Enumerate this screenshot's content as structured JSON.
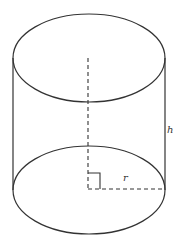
{
  "diagram": {
    "type": "cylinder",
    "labels": {
      "height": "h",
      "radius": "r"
    },
    "colors": {
      "stroke": "#333333",
      "background": "#ffffff"
    },
    "geometry": {
      "top_ellipse": {
        "cx": 89,
        "cy": 58,
        "rx": 76,
        "ry": 44
      },
      "bottom_ellipse": {
        "cx": 89,
        "cy": 190,
        "rx": 76,
        "ry": 44
      },
      "axis": {
        "x": 88,
        "y_top": 58,
        "y_bottom": 189
      },
      "radius_line": {
        "y": 189,
        "x_start": 88,
        "x_end": 164
      },
      "right_angle_marker": {
        "x": 88,
        "y": 173,
        "size": 12
      }
    }
  }
}
